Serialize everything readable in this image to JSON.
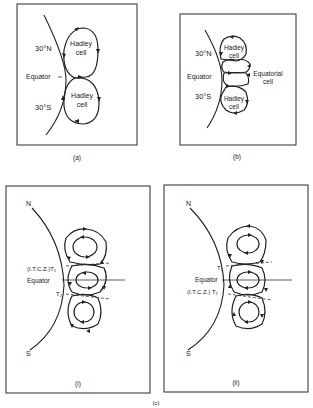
{
  "figure": {
    "caption_c": "(c)",
    "panels": {
      "a": {
        "caption": "(a)",
        "labels": {
          "north": "30°N",
          "equator": "Equator",
          "south": "30°S"
        },
        "cells": [
          {
            "name_line1": "Hadley",
            "name_line2": "cell"
          },
          {
            "name_line1": "Hadley",
            "name_line2": "cell"
          }
        ]
      },
      "b": {
        "caption": "(b)",
        "labels": {
          "north": "30°N",
          "equator": "Equator",
          "south": "30°S"
        },
        "cells": [
          {
            "name_line1": "Hadley",
            "name_line2": "cell"
          },
          {
            "name_line1": "Equatorial",
            "name_line2": "cell"
          },
          {
            "name_line1": "Hadley",
            "name_line2": "cell"
          }
        ]
      },
      "c_i": {
        "caption": "(i)",
        "labels": {
          "north": "N",
          "south": "S",
          "t1": "(I.T.C.Z.)T₁",
          "equator": "Equator",
          "t2": "T₂"
        }
      },
      "c_ii": {
        "caption": "(ii)",
        "labels": {
          "north": "N",
          "south": "S",
          "t1": "T₁",
          "equator": "Equator",
          "t2": "(I.T.C.Z.) T₂"
        }
      }
    }
  }
}
